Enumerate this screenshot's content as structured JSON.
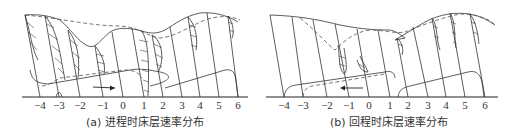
{
  "panels": [
    {
      "id": "a",
      "caption": "(a) 进程时床层速率分布",
      "direction": "right",
      "ticks": [
        "−4",
        "−3",
        "−2",
        "−1",
        "0",
        "1",
        "2",
        "3",
        "4",
        "5",
        "6"
      ],
      "tick_x": [
        40,
        59,
        80,
        103,
        123,
        144,
        163,
        182,
        200,
        219,
        238
      ]
    },
    {
      "id": "b",
      "caption": "(b) 回程时床层速率分布",
      "direction": "left",
      "ticks": [
        "−4",
        "−3",
        "−2",
        "−1",
        "0",
        "1",
        "2",
        "3",
        "4",
        "5",
        "6"
      ],
      "tick_x": [
        284,
        303,
        327,
        349,
        369,
        390,
        408,
        428,
        446,
        465,
        485
      ]
    }
  ]
}
